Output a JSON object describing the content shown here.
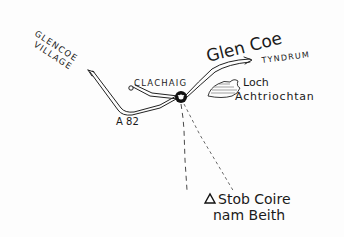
{
  "map": {
    "title": "Glen Coe",
    "labels": {
      "glencoe_village_line1": "GLENCOE",
      "glencoe_village_line2": "VILLAGE",
      "clachaig": "CLACHAIG",
      "tyndrum": "TYNDRUM",
      "road_number": "A 82",
      "loch_line1": "Loch",
      "loch_line2": "Achtriochtan",
      "summit_line1": "Stob Coire",
      "summit_line2": "nam Beith"
    },
    "symbols": {
      "summit": "triangle-icon",
      "start_point": "parking-junction-icon",
      "loch": "loch-hatched-shape"
    },
    "colors": {
      "ink": "#1a1a1a",
      "paper": "#fdfdfd"
    }
  }
}
